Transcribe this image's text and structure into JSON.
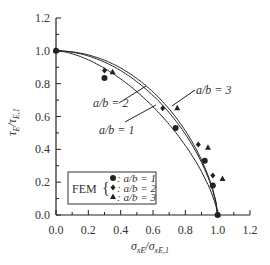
{
  "chart_data": {
    "type": "line",
    "title": "",
    "xlabel": "σxE/σxE,1",
    "ylabel": "τE/τE,1",
    "xlim": [
      0,
      1.2
    ],
    "ylim": [
      0,
      1.2
    ],
    "xticks": [
      "0.0",
      "0.2",
      "0.4",
      "0.6",
      "0.8",
      "1.0",
      "1.2"
    ],
    "yticks": [
      "0.0",
      "0.2",
      "0.4",
      "0.6",
      "0.8",
      "1.0",
      "1.2"
    ],
    "grid": false,
    "series": [
      {
        "name": "a/b = 1",
        "kind": "curve",
        "exponent": 1.6
      },
      {
        "name": "a/b = 2",
        "kind": "curve",
        "exponent": 1.9
      },
      {
        "name": "a/b = 3",
        "kind": "curve",
        "exponent": 2.05
      }
    ],
    "fem_points": [
      {
        "name": "FEM: a/b = 1",
        "marker": "circle",
        "x": [
          0,
          0.3,
          0.74,
          0.92,
          0.97,
          1.0
        ],
        "y": [
          1.0,
          0.835,
          0.53,
          0.33,
          0.18,
          0.0
        ]
      },
      {
        "name": "FEM: a/b = 2",
        "marker": "diamond",
        "x": [
          0,
          0.3,
          0.66,
          0.88,
          0.97,
          1.0
        ],
        "y": [
          1.0,
          0.88,
          0.65,
          0.43,
          0.24,
          0.0
        ]
      },
      {
        "name": "FEM: a/b = 3",
        "marker": "triangle",
        "x": [
          0,
          0.35,
          0.75,
          0.94,
          1.03,
          1.0
        ],
        "y": [
          1.0,
          0.87,
          0.65,
          0.41,
          0.22,
          0.0
        ]
      }
    ],
    "annotations": [
      {
        "text": "a/b = 1",
        "x": 0.45,
        "y": 0.5
      },
      {
        "text": "a/b = 2",
        "x": 0.18,
        "y": 0.72
      },
      {
        "text": "a/b = 3",
        "x": 0.85,
        "y": 0.72
      }
    ],
    "legend": {
      "title": "FEM",
      "position": "lower-left",
      "entries": [
        ": a/b = 1",
        ": a/b = 2",
        ": a/b = 3"
      ]
    }
  }
}
